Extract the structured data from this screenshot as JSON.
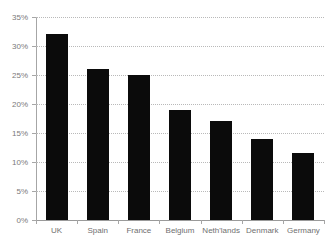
{
  "chart_data": {
    "type": "bar",
    "title": "",
    "xlabel": "",
    "ylabel": "",
    "categories": [
      "UK",
      "Spain",
      "France",
      "Belgium",
      "Neth'lands",
      "Denmark",
      "Germany"
    ],
    "values": [
      32,
      26,
      25,
      19,
      17,
      14,
      11.5
    ],
    "value_labels": [
      "32%",
      "26%",
      "25%",
      "19%",
      "17%",
      "14%",
      "11.5%"
    ],
    "ylim": [
      0,
      35
    ],
    "ytick_values": [
      35,
      30,
      25,
      20,
      15,
      10,
      5,
      0
    ],
    "ytick_labels": [
      "35%",
      "30%",
      "25%",
      "20%",
      "15%",
      "10%",
      "5%",
      "0%"
    ],
    "grid": true,
    "grid_axis": "y",
    "legend": false,
    "legend_position": "none",
    "bar_color": "#0b0b0b",
    "grid_color": "#b9b9b9",
    "axis_color": "#a6a6a6",
    "tick_label_color": "#7a7a7a",
    "background_color": "#ffffff"
  },
  "clipped_title": {
    "text": ""
  }
}
